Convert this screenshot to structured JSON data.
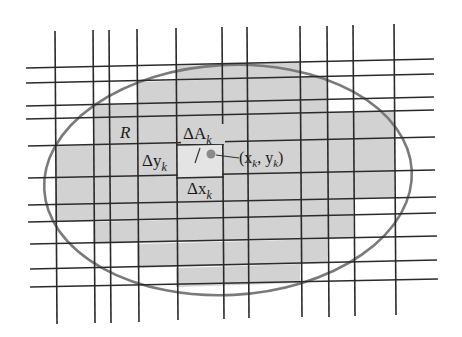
{
  "diagram": {
    "type": "partition of region R into rectangles",
    "labels": {
      "region": "R",
      "delta_a": "ΔA",
      "delta_a_sub": "k",
      "delta_y": "Δy",
      "delta_y_sub": "k",
      "delta_x": "Δx",
      "delta_x_sub": "k",
      "point_open": "(x",
      "point_sub1": "k",
      "point_mid": ", y",
      "point_sub2": "k",
      "point_close": ")"
    },
    "colors": {
      "background": "#ffffff",
      "shaded_cells": "#d2d2d2",
      "grid_lines": "#2a2a2a",
      "region_outline": "#7a7a7a",
      "sample_point": "#8a8a8a"
    },
    "vertical_lines_x": [
      55,
      93,
      109,
      137,
      176,
      222,
      247,
      300,
      327,
      353,
      394
    ],
    "horizontal_lines_y_left": [
      67,
      83,
      106,
      119,
      146,
      178,
      205,
      222,
      244,
      269,
      287
    ],
    "horizontal_lines_y_right": [
      60,
      74,
      98,
      111,
      137,
      170,
      197,
      213,
      236,
      260,
      279
    ]
  }
}
